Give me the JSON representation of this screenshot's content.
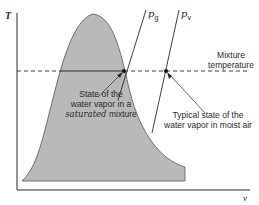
{
  "axes": {
    "y_label": "T",
    "x_label": "v"
  },
  "lines": {
    "pg_label": "p",
    "pg_subscript": "g",
    "pv_label": "p",
    "pv_subscript": "v"
  },
  "annotations": {
    "mixture_temperature_line1": "Mixture",
    "mixture_temperature_line2": "temperature",
    "saturated_line1": "State of the",
    "saturated_line2": "water vapor in a",
    "saturated_line3_italic": "saturated",
    "saturated_line3_rest": " mixture",
    "typical_line1": "Typical state of the",
    "typical_line2": "water vapor in moist air"
  },
  "colors": {
    "dome_fill": "#b9b9b9",
    "line": "#2a2a2a",
    "background": "#ffffff"
  }
}
